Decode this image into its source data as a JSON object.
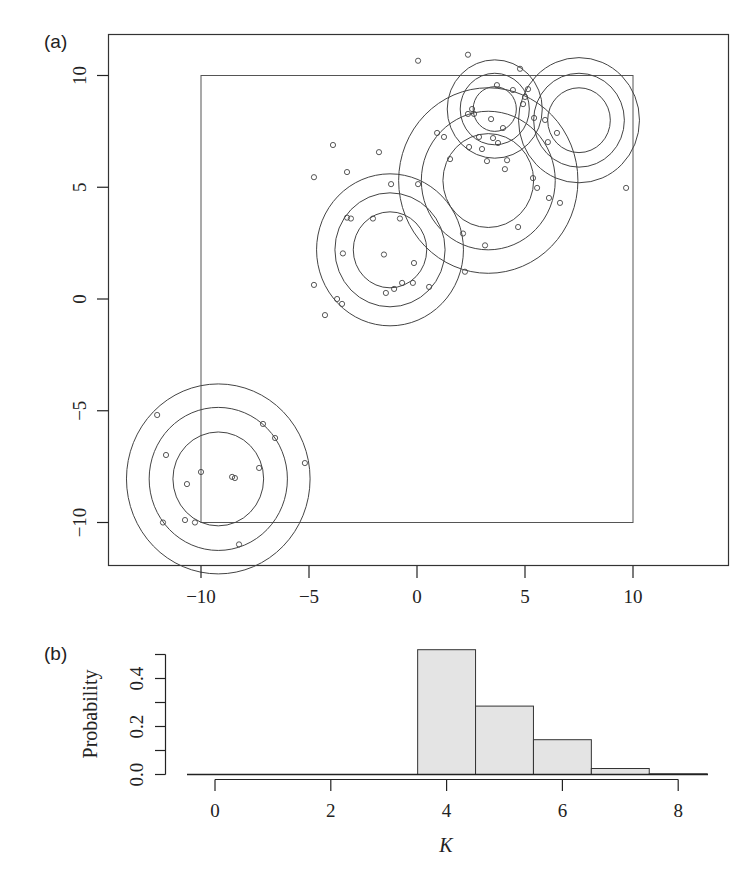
{
  "panels": {
    "a_label": "(a)",
    "b_label": "(b)"
  },
  "chart_data": [
    {
      "type": "scatter",
      "panel": "(a)",
      "title": "",
      "xlabel": "",
      "ylabel": "",
      "xlim": [
        -14.3,
        14.3
      ],
      "ylim": [
        -11.9,
        12.0
      ],
      "xticks": [
        -10,
        -5,
        0,
        5,
        10
      ],
      "yticks": [
        -10,
        -5,
        0,
        5,
        10
      ],
      "xtick_labels": [
        "−10",
        "−5",
        "0",
        "5",
        "10"
      ],
      "ytick_labels": [
        "−10",
        "−5",
        "0",
        "5",
        "10"
      ],
      "grid": false,
      "inner_box": {
        "x": [
          -10,
          10
        ],
        "y": [
          -10,
          10
        ]
      },
      "circles": [
        {
          "cx": 3.3,
          "cy": 5.3,
          "radii": [
            2.1,
            3.1,
            4.15
          ]
        },
        {
          "cx": 3.6,
          "cy": 8.5,
          "radii": [
            1.0,
            1.6,
            2.2
          ]
        },
        {
          "cx": 7.5,
          "cy": 8.0,
          "radii": [
            1.45,
            2.1,
            2.8
          ]
        },
        {
          "cx": -1.25,
          "cy": 2.2,
          "radii": [
            1.7,
            2.55,
            3.4
          ]
        },
        {
          "cx": -9.2,
          "cy": -8.05,
          "radii": [
            2.1,
            3.2,
            4.25
          ]
        }
      ],
      "points": [
        [
          0.05,
          10.66
        ],
        [
          2.36,
          10.93
        ],
        [
          4.77,
          10.3
        ],
        [
          3.7,
          9.57
        ],
        [
          4.44,
          9.35
        ],
        [
          5.14,
          9.39
        ],
        [
          5.0,
          9.04
        ],
        [
          4.91,
          8.72
        ],
        [
          2.55,
          8.5
        ],
        [
          2.64,
          8.28
        ],
        [
          2.36,
          8.28
        ],
        [
          3.43,
          8.05
        ],
        [
          3.98,
          7.65
        ],
        [
          5.42,
          8.1
        ],
        [
          5.93,
          8.01
        ],
        [
          0.93,
          7.43
        ],
        [
          1.25,
          7.25
        ],
        [
          2.87,
          7.25
        ],
        [
          3.52,
          7.2
        ],
        [
          3.75,
          6.98
        ],
        [
          2.41,
          6.8
        ],
        [
          3.01,
          6.71
        ],
        [
          6.06,
          7.02
        ],
        [
          6.48,
          7.43
        ],
        [
          1.53,
          6.26
        ],
        [
          3.24,
          6.17
        ],
        [
          4.17,
          6.21
        ],
        [
          4.07,
          5.81
        ],
        [
          5.37,
          5.41
        ],
        [
          5.56,
          4.97
        ],
        [
          6.11,
          4.52
        ],
        [
          6.62,
          4.3
        ],
        [
          9.68,
          4.97
        ],
        [
          -3.89,
          6.89
        ],
        [
          -1.76,
          6.57
        ],
        [
          -1.2,
          5.14
        ],
        [
          0.05,
          5.14
        ],
        [
          -4.77,
          5.45
        ],
        [
          -3.24,
          5.68
        ],
        [
          -3.24,
          3.64
        ],
        [
          -3.06,
          3.6
        ],
        [
          -2.04,
          3.6
        ],
        [
          -0.79,
          3.6
        ],
        [
          -3.43,
          2.04
        ],
        [
          -1.53,
          1.99
        ],
        [
          -0.14,
          1.61
        ],
        [
          2.13,
          2.93
        ],
        [
          3.15,
          2.4
        ],
        [
          4.68,
          3.22
        ],
        [
          2.22,
          1.22
        ],
        [
          -4.77,
          0.63
        ],
        [
          -0.69,
          0.72
        ],
        [
          -0.19,
          0.72
        ],
        [
          -1.06,
          0.45
        ],
        [
          -1.44,
          0.27
        ],
        [
          0.56,
          0.54
        ],
        [
          -3.7,
          0.0
        ],
        [
          -3.47,
          -0.22
        ],
        [
          -4.26,
          -0.72
        ],
        [
          -12.03,
          -5.19
        ],
        [
          -7.13,
          -5.59
        ],
        [
          -6.57,
          -6.22
        ],
        [
          -11.62,
          -6.98
        ],
        [
          -5.19,
          -7.34
        ],
        [
          -7.31,
          -7.56
        ],
        [
          -10.0,
          -7.74
        ],
        [
          -8.56,
          -7.96
        ],
        [
          -8.43,
          -8.01
        ],
        [
          -10.65,
          -8.28
        ],
        [
          -11.76,
          -10.0
        ],
        [
          -10.74,
          -9.89
        ],
        [
          -10.28,
          -10.0
        ],
        [
          -8.24,
          -10.98
        ]
      ]
    },
    {
      "type": "bar",
      "panel": "(b)",
      "title": "",
      "xlabel": "K",
      "ylabel": "Probability",
      "categories": [
        0,
        1,
        2,
        3,
        4,
        5,
        6,
        7,
        8
      ],
      "values": [
        0.0,
        0.0,
        0.0,
        0.0,
        0.52,
        0.285,
        0.145,
        0.025,
        0.003
      ],
      "xticks": [
        0,
        2,
        4,
        6,
        8
      ],
      "yticks": [
        0.0,
        0.1,
        0.2,
        0.3,
        0.4,
        0.5
      ],
      "ytick_labels": [
        "0.0",
        "0.2",
        "0.4"
      ],
      "ylim": [
        0,
        0.5
      ],
      "bar_color": "#e4e4e4",
      "grid": false
    }
  ]
}
